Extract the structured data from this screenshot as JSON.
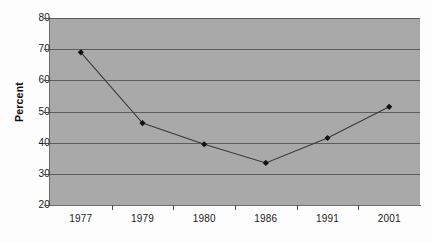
{
  "chart_data": {
    "type": "line",
    "title": "",
    "subtitle": "",
    "xlabel": "",
    "ylabel": "Percent",
    "categories": [
      "1977",
      "1979",
      "1980",
      "1986",
      "1991",
      "2001"
    ],
    "values": [
      69.0,
      46.3,
      39.5,
      33.5,
      41.5,
      51.5
    ],
    "series": [
      {
        "name": "Percent",
        "values": [
          69.0,
          46.3,
          39.5,
          33.5,
          41.5,
          51.5
        ]
      }
    ],
    "ylim": [
      20,
      80
    ],
    "yticks": [
      20,
      30,
      40,
      50,
      60,
      70,
      80
    ],
    "ytick_labels": [
      "20",
      "30",
      "40",
      "50",
      "60",
      "70",
      "80"
    ],
    "grid": true,
    "grid_axis": "y",
    "legend": false,
    "legend_position": "none",
    "marker": "diamond",
    "annotations": []
  },
  "style": {
    "plot_background": "#a9a9a9",
    "page_background": "#fdfdfd",
    "gridline_color": "#5d5d5d",
    "axis_color": "#6e6e6e",
    "series_line_color": "#3a3a3a",
    "marker_color": "#111111",
    "tick_label_color": "#1b1b1b"
  }
}
